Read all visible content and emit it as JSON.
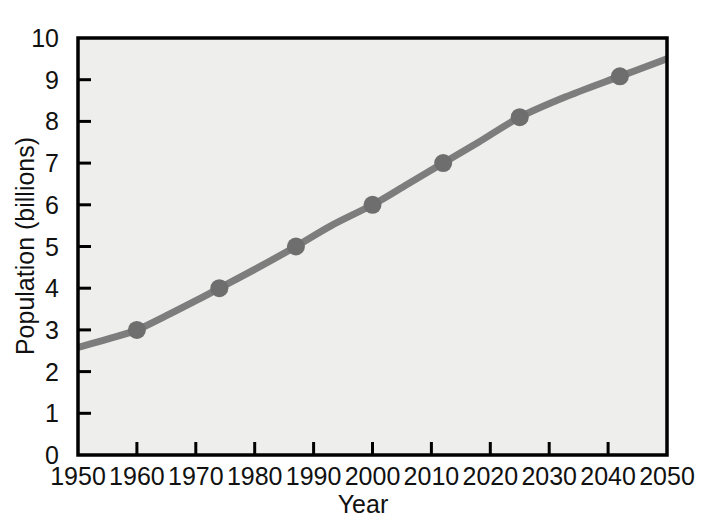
{
  "chart_data": {
    "type": "line",
    "title": "",
    "subtitle": "",
    "xlabel": "Year",
    "ylabel": "Population (billions)",
    "xlim": [
      1950,
      2050
    ],
    "ylim": [
      0,
      10
    ],
    "grid": false,
    "legend": null,
    "x_ticks": [
      1950,
      1960,
      1970,
      1980,
      1990,
      2000,
      2010,
      2020,
      2030,
      2040,
      2050
    ],
    "x_tick_labels": [
      "1950",
      "1960",
      "1970",
      "1980",
      "1990",
      "2000",
      "2010",
      "2020",
      "2030",
      "2040",
      "2050"
    ],
    "y_ticks": [
      0,
      1,
      2,
      3,
      4,
      5,
      6,
      7,
      8,
      9,
      10
    ],
    "y_tick_labels": [
      "0",
      "1",
      "2",
      "3",
      "4",
      "5",
      "6",
      "7",
      "8",
      "9",
      "10"
    ],
    "series": [
      {
        "name": "World population",
        "color": "#7d7d7d",
        "line_width": 7,
        "marker": "circle",
        "marker_size": 18,
        "curve_points": [
          {
            "x": 1950,
            "y": 2.58
          },
          {
            "x": 1955,
            "y": 2.78
          },
          {
            "x": 1960,
            "y": 3.0
          },
          {
            "x": 1965,
            "y": 3.34
          },
          {
            "x": 1970,
            "y": 3.7
          },
          {
            "x": 1974,
            "y": 4.0
          },
          {
            "x": 1980,
            "y": 4.45
          },
          {
            "x": 1987,
            "y": 5.0
          },
          {
            "x": 1993,
            "y": 5.5
          },
          {
            "x": 2000,
            "y": 6.0
          },
          {
            "x": 2006,
            "y": 6.5
          },
          {
            "x": 2012,
            "y": 7.0
          },
          {
            "x": 2018,
            "y": 7.5
          },
          {
            "x": 2025,
            "y": 8.1
          },
          {
            "x": 2033,
            "y": 8.6
          },
          {
            "x": 2042,
            "y": 9.08
          },
          {
            "x": 2050,
            "y": 9.5
          }
        ],
        "data_points": [
          {
            "x": 1960,
            "y": 3.0,
            "label": "3 billion in 1960"
          },
          {
            "x": 1974,
            "y": 4.0,
            "label": "4 billion in 1974"
          },
          {
            "x": 1987,
            "y": 5.0,
            "label": "5 billion in 1987"
          },
          {
            "x": 2000,
            "y": 6.0,
            "label": "6 billion in 2000"
          },
          {
            "x": 2012,
            "y": 7.0,
            "label": "7 billion in 2012"
          },
          {
            "x": 2025,
            "y": 8.1,
            "label": "8 billion in 2025"
          },
          {
            "x": 2042,
            "y": 9.08,
            "label": "9 billion in 2042"
          }
        ]
      }
    ],
    "colors": {
      "line": "#7d7d7d",
      "marker": "#6e6e6e",
      "plot_background": "#eeeeec",
      "frame": "#000000",
      "text": "#111111",
      "page_background": "#ffffff"
    }
  }
}
